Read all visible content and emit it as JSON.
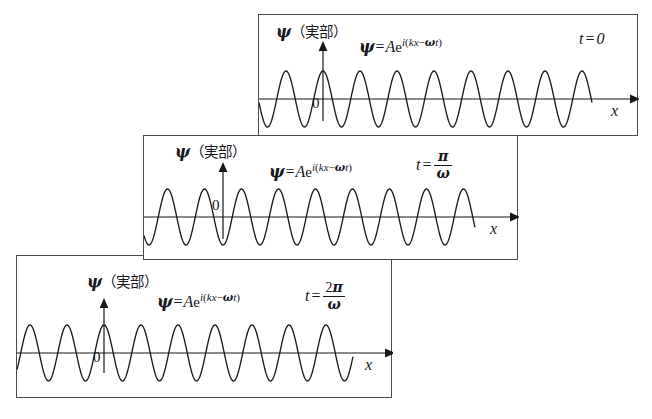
{
  "figure": {
    "background_color": "#ffffff",
    "panel_border_color": "#4a4a52",
    "curve_color": "#1a1a1a",
    "axis_color": "#17171c"
  },
  "common": {
    "y_axis_label_psi": "ψ",
    "y_axis_label_jp": "（実部）",
    "origin_label": "0",
    "x_axis_label": "x",
    "formula": {
      "lhs": "ψ",
      "equals": "=",
      "amplitude": "A",
      "base": "e",
      "exponent_i": "i",
      "exponent_open": "(",
      "exponent_kx": "kx",
      "exponent_minus": "−",
      "exponent_omega": "ω",
      "exponent_t": "t",
      "exponent_close": ")",
      "plain": "ψ = Ae^{i(kx−ωt)}"
    }
  },
  "panels": [
    {
      "id": "panel-t0",
      "time_label": {
        "variable": "t",
        "equals": "=",
        "is_fraction": false,
        "value": "0",
        "plain": "t = 0"
      },
      "phase_description": "crest at x = 0",
      "phase_radians": 0,
      "wave": {
        "wavelength_px": 37,
        "amplitude_px": 28,
        "cycles_drawn": 9
      }
    },
    {
      "id": "panel-t-pi-over-omega",
      "time_label": {
        "variable": "t",
        "equals": "=",
        "is_fraction": true,
        "numerator": "π",
        "numerator_coefficient": "",
        "denominator": "ω",
        "plain": "t = π/ω"
      },
      "phase_description": "trough at x = 0",
      "phase_radians": 3.14159,
      "wave": {
        "wavelength_px": 37,
        "amplitude_px": 28,
        "cycles_drawn": 9
      }
    },
    {
      "id": "panel-t-2pi-over-omega",
      "time_label": {
        "variable": "t",
        "equals": "=",
        "is_fraction": true,
        "numerator": "π",
        "numerator_coefficient": "2",
        "denominator": "ω",
        "plain": "t = 2π/ω"
      },
      "phase_description": "crest at x = 0",
      "phase_radians": 6.28319,
      "wave": {
        "wavelength_px": 37,
        "amplitude_px": 28,
        "cycles_drawn": 9
      }
    }
  ],
  "chart_data": {
    "type": "line",
    "xlabel": "x",
    "ylabel": "ψ（実部）",
    "grid": false,
    "legend": "none",
    "annotations": [
      "ψ = Ae^{i(kx−ωt)}",
      "t=0",
      "t=π/ω",
      "t=2π/ω"
    ],
    "series": [
      {
        "name": "t = 0",
        "function": "A cos(kx)",
        "phase_deg": 0,
        "amplitude": 1
      },
      {
        "name": "t = π/ω",
        "function": "A cos(kx − π)",
        "phase_deg": 180,
        "amplitude": 1
      },
      {
        "name": "t = 2π/ω",
        "function": "A cos(kx − 2π)",
        "phase_deg": 360,
        "amplitude": 1
      }
    ],
    "ylim": [
      -1,
      1
    ],
    "xlim": [
      0,
      1
    ]
  }
}
